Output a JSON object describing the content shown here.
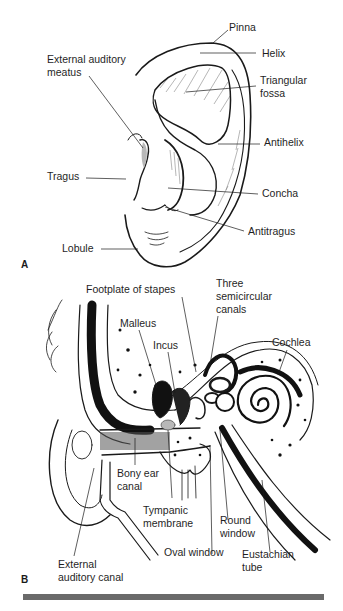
{
  "figure": {
    "panel_a": {
      "letter": "A",
      "subject": "External ear (pinna)",
      "labels": {
        "pinna": "Pinna",
        "helix": "Helix",
        "eam_line1": "External auditory",
        "eam_line2": "meatus",
        "tri_line1": "Triangular",
        "tri_line2": "fossa",
        "antihelix": "Antihelix",
        "tragus": "Tragus",
        "concha": "Concha",
        "antitragus": "Antitragus",
        "lobule": "Lobule"
      }
    },
    "panel_b": {
      "letter": "B",
      "subject": "Cross-section of outer, middle and inner ear",
      "labels": {
        "footplate": "Footplate of stapes",
        "three_line1": "Three",
        "three_line2": "semicircular",
        "three_line3": "canals",
        "malleus": "Malleus",
        "incus": "Incus",
        "cochlea": "Cochlea",
        "bony_line1": "Bony ear",
        "bony_line2": "canal",
        "tymp_line1": "Tympanic",
        "tymp_line2": "membrane",
        "round_line1": "Round",
        "round_line2": "window",
        "oval": "Oval window",
        "eust_line1": "Eustachian",
        "eust_line2": "tube",
        "eac_line1": "External",
        "eac_line2": "auditory canal"
      }
    },
    "colors": {
      "ink": "#1a1a1a",
      "shade": "#b8b8b8",
      "rule": "#6a6a6a"
    }
  }
}
